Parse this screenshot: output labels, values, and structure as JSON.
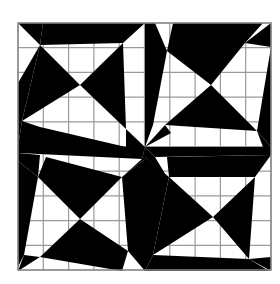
{
  "figure": {
    "grid": {
      "rows": 10,
      "cols": 10,
      "line_color": "#9a9a9a"
    },
    "colors": {
      "fill": "#000000",
      "background": "#ffffff",
      "border": "#8a8a8a"
    },
    "quadrants": [
      {
        "id": "top-left",
        "hourglass": "horizontal-black"
      },
      {
        "id": "top-right",
        "hourglass": "vertical-black"
      },
      {
        "id": "bottom-left",
        "hourglass": "vertical-black"
      },
      {
        "id": "bottom-right",
        "hourglass": "horizontal-black"
      }
    ]
  }
}
